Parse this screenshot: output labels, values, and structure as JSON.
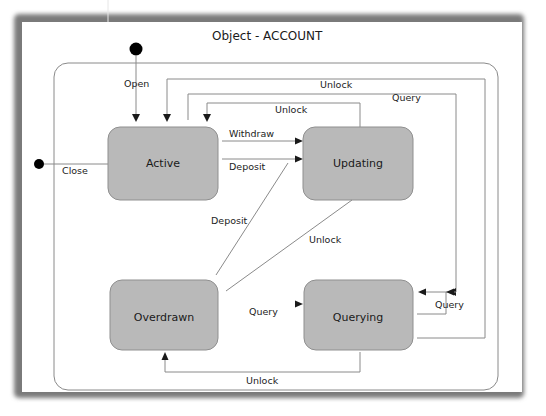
{
  "diagram": {
    "title": "Object - ACCOUNT",
    "states": {
      "active": "Active",
      "updating": "Updating",
      "overdrawn": "Overdrawn",
      "querying": "Querying"
    },
    "transitions": {
      "open": "Open",
      "close": "Close",
      "withdraw": "Withdraw",
      "deposit_active_updating": "Deposit",
      "deposit_overdrawn_updating": "Deposit",
      "unlock_updating_overdrawn": "Unlock",
      "unlock_outer": "Unlock",
      "unlock_inner": "Unlock",
      "query_outer": "Query",
      "query_overdrawn_querying": "Query",
      "query_self": "Query",
      "unlock_querying_overdrawn": "Unlock"
    },
    "colors": {
      "state_fill": "#b9b9b9",
      "state_stroke": "#8f8f8f",
      "line": "#8a8a8a",
      "frame_shadow": "#7a7a7a"
    }
  }
}
